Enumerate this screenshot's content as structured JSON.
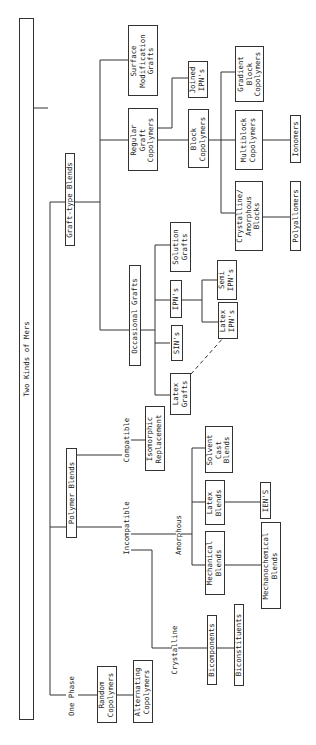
{
  "diagram": {
    "orientation": "rotated-90-ccw",
    "root": {
      "label": "Two Kinds of Mers"
    },
    "nodes": {
      "graft_type_blends": "Graft-type Blends",
      "polymer_blends": "Polymer Blends",
      "one_phase": "One Phase",
      "surface_modification_grafts": "Surface\nModification\nGrafts",
      "regular_graft_copolymers": "Regular\nGraft\nCopolymers",
      "joined_ipns": "Joined\nIPN's",
      "block_copolymers": "Block\nCopolymers",
      "gradient_block_copolymers": "Gradient\nBlock\nCopolymers",
      "multiblock_copolymers": "Multiblock\nCopolymers",
      "crystalline_amorphous_blocks": "Crystalline/\nAmorphous\nBlocks",
      "ionomers": "Ionomers",
      "polyallomers": "Polyallomers",
      "occasional_grafts": "Occasional Grafts",
      "latex_grafts": "Latex\nGrafts",
      "sins": "SIN's",
      "ipns": "IPN's",
      "solution_grafts": "Solution\nGrafts",
      "latex_ipns": "Latex\nIPN's",
      "semi_ipns": "Semi\nIPN's",
      "compatible": "Compatible",
      "isomorphic_replacement": "Isomorphic\nReplacement",
      "incompatible": "Incompatible",
      "amorphous": "Amorphous",
      "mechanical_blends": "Mechanical\nBlends",
      "latex_blends": "Latex\nBlends",
      "solvent_cast_blends": "Solvent\nCast\nBlends",
      "iens": "IEN'S",
      "mechanochemical_blends": "Mechanochemical\nBlends",
      "crystalline": "Crystalline",
      "bicomponents": "Bicomponents",
      "biconstituents": "Biconstituents",
      "random_copolymers": "Random\nCopolymers",
      "alternating_copolymers": "Alternating\nCopolymers"
    },
    "edges": [
      [
        "root",
        "graft_type_blends"
      ],
      [
        "root",
        "polymer_blends"
      ],
      [
        "root",
        "one_phase"
      ],
      [
        "graft_type_blends",
        "surface_modification_grafts"
      ],
      [
        "graft_type_blends",
        "regular_graft_copolymers"
      ],
      [
        "graft_type_blends",
        "occasional_grafts"
      ],
      [
        "regular_graft_copolymers",
        "joined_ipns"
      ],
      [
        "regular_graft_copolymers",
        "block_copolymers"
      ],
      [
        "block_copolymers",
        "gradient_block_copolymers"
      ],
      [
        "block_copolymers",
        "multiblock_copolymers"
      ],
      [
        "block_copolymers",
        "crystalline_amorphous_blocks"
      ],
      [
        "multiblock_copolymers",
        "ionomers"
      ],
      [
        "crystalline_amorphous_blocks",
        "polyallomers"
      ],
      [
        "occasional_grafts",
        "latex_grafts"
      ],
      [
        "occasional_grafts",
        "sins"
      ],
      [
        "occasional_grafts",
        "ipns"
      ],
      [
        "occasional_grafts",
        "solution_grafts"
      ],
      [
        "ipns",
        "latex_ipns"
      ],
      [
        "ipns",
        "semi_ipns"
      ],
      [
        "polymer_blends",
        "compatible"
      ],
      [
        "polymer_blends",
        "incompatible"
      ],
      [
        "compatible",
        "isomorphic_replacement"
      ],
      [
        "incompatible",
        "amorphous"
      ],
      [
        "incompatible",
        "crystalline"
      ],
      [
        "amorphous",
        "mechanical_blends"
      ],
      [
        "amorphous",
        "latex_blends"
      ],
      [
        "amorphous",
        "solvent_cast_blends"
      ],
      [
        "latex_blends",
        "iens"
      ],
      [
        "mechanical_blends",
        "mechanochemical_blends"
      ],
      [
        "crystalline",
        "bicomponents"
      ],
      [
        "bicomponents",
        "biconstituents"
      ],
      [
        "one_phase",
        "random_copolymers"
      ],
      [
        "random_copolymers",
        "alternating_copolymers"
      ]
    ],
    "dashed_edges": [
      [
        "latex_grafts",
        "latex_ipns"
      ]
    ],
    "line_color": "#333333"
  }
}
